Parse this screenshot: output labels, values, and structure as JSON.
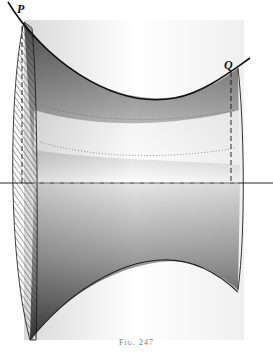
{
  "figure": {
    "type": "surface-of-revolution illustration",
    "labels": {
      "point_p": "P",
      "point_q": "Q"
    },
    "caption": "Fig. 247",
    "colors": {
      "ink": "#111111",
      "shade_dark": "#555555",
      "shade_light": "#d8d8d8",
      "paper": "#ffffff"
    }
  }
}
